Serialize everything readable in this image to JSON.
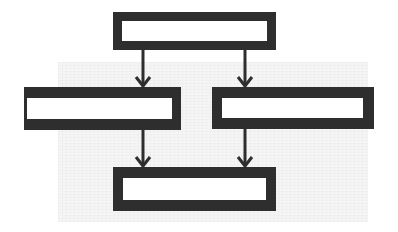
{
  "diagram": {
    "type": "flowchart",
    "colors": {
      "stroke": "#2e2e2e",
      "box_fill": "#ffffff",
      "background": "#ffffff"
    },
    "nodes": [
      {
        "id": "top",
        "label": "",
        "x": 113,
        "y": 12,
        "w": 163,
        "h": 38,
        "border": [
          9,
          9,
          9,
          9
        ]
      },
      {
        "id": "left",
        "label": "",
        "x": 24,
        "y": 87,
        "w": 157,
        "h": 43,
        "border": [
          11,
          9,
          11,
          3
        ]
      },
      {
        "id": "right",
        "label": "",
        "x": 212,
        "y": 87,
        "w": 162,
        "h": 42,
        "border": [
          11,
          11,
          11,
          10
        ]
      },
      {
        "id": "bottom",
        "label": "",
        "x": 113,
        "y": 167,
        "w": 163,
        "h": 44,
        "border": [
          11,
          10,
          11,
          10
        ]
      }
    ],
    "edges": [
      {
        "from": "top",
        "to": "left",
        "x": 143,
        "y1": 50,
        "y2": 87
      },
      {
        "from": "top",
        "to": "right",
        "x": 245,
        "y1": 50,
        "y2": 87
      },
      {
        "from": "left",
        "to": "bottom",
        "x": 143,
        "y1": 130,
        "y2": 167
      },
      {
        "from": "right",
        "to": "bottom",
        "x": 245,
        "y1": 129,
        "y2": 167
      }
    ]
  }
}
